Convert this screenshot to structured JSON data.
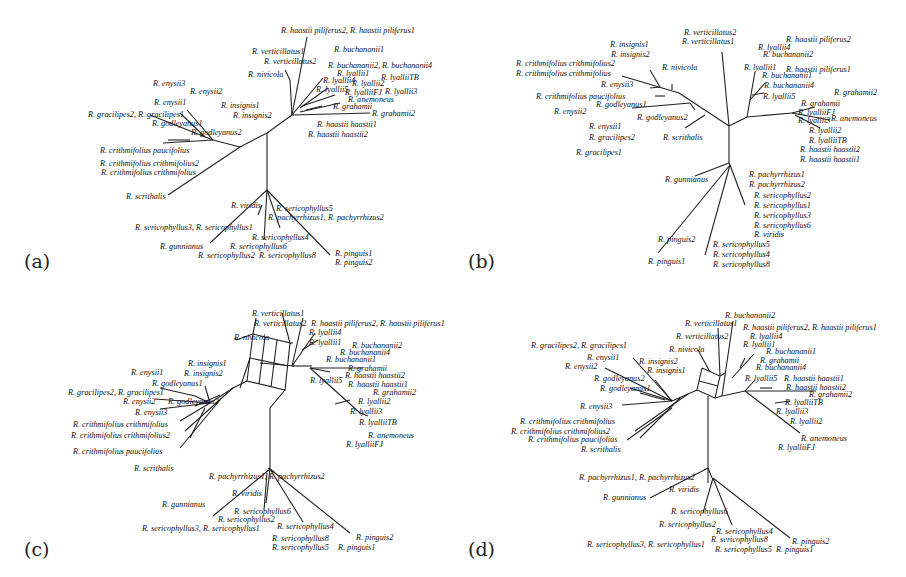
{
  "figure": {
    "panels": [
      {
        "id": "a",
        "label": "(a)",
        "type": "tree",
        "taxa": [
          {
            "text": "R. haastii piliferus2, R. haastii piliferus1",
            "x": 281,
            "y": 27
          },
          {
            "text": "R. buchananii1",
            "x": 334,
            "y": 46
          },
          {
            "text": "R. verticillatus1",
            "x": 252,
            "y": 48
          },
          {
            "text": "R. verticillatus2",
            "x": 264,
            "y": 58
          },
          {
            "text": "R. buchananii2, R. buchananii4",
            "x": 328,
            "y": 62
          },
          {
            "text": "R. lyallii1",
            "x": 337,
            "y": 70
          },
          {
            "text": "R. nivicola",
            "x": 248,
            "y": 71
          },
          {
            "text": "R. lyallii4",
            "x": 323,
            "y": 77
          },
          {
            "text": "R. lyallii2",
            "x": 352,
            "y": 80
          },
          {
            "text": "R. lyalliiTB",
            "x": 381,
            "y": 74
          },
          {
            "text": "R. lyallii5",
            "x": 316,
            "y": 86
          },
          {
            "text": "R. lyalliiFJ",
            "x": 345,
            "y": 89
          },
          {
            "text": "R. lyallii3",
            "x": 385,
            "y": 88
          },
          {
            "text": "R. anemoneus",
            "x": 348,
            "y": 96
          },
          {
            "text": "R. grahamii",
            "x": 333,
            "y": 103
          },
          {
            "text": "R. grahamii2",
            "x": 372,
            "y": 110
          },
          {
            "text": "R. haastii haastii1",
            "x": 317,
            "y": 121
          },
          {
            "text": "R. haastii haastii2",
            "x": 308,
            "y": 131
          },
          {
            "text": "R. enysii3",
            "x": 153,
            "y": 80
          },
          {
            "text": "R. enysii2",
            "x": 190,
            "y": 88
          },
          {
            "text": "R. enysii1",
            "x": 154,
            "y": 99
          },
          {
            "text": "R. insignis1",
            "x": 221,
            "y": 102
          },
          {
            "text": "R. gracilipes2, R. gracilipes1",
            "x": 88,
            "y": 111
          },
          {
            "text": "R. insignis2",
            "x": 233,
            "y": 112
          },
          {
            "text": "R. godleyanus1",
            "x": 152,
            "y": 120
          },
          {
            "text": "R. godleyanus2",
            "x": 191,
            "y": 129
          },
          {
            "text": "R. crithmifolius paucifolius",
            "x": 100,
            "y": 147
          },
          {
            "text": "R. crithmifolius crithmifolius2",
            "x": 100,
            "y": 160
          },
          {
            "text": "R. crithmifolius crithmifolius",
            "x": 101,
            "y": 169
          },
          {
            "text": "R. scrithalis",
            "x": 126,
            "y": 193
          },
          {
            "text": "R. viridis",
            "x": 231,
            "y": 202
          },
          {
            "text": "R. sericophyllus5",
            "x": 276,
            "y": 205
          },
          {
            "text": "R. pachyrrhizus1, R. pachyrrhizus2",
            "x": 268,
            "y": 214
          },
          {
            "text": "R. sericophyllus3, R. sericophyllus1",
            "x": 135,
            "y": 224
          },
          {
            "text": "R. sericophyllus4",
            "x": 252,
            "y": 234
          },
          {
            "text": "R. gunnianus",
            "x": 160,
            "y": 243
          },
          {
            "text": "R. sericophyllus6",
            "x": 230,
            "y": 243
          },
          {
            "text": "R. sericophyllus2",
            "x": 198,
            "y": 252
          },
          {
            "text": "R. sericophyllus8",
            "x": 259,
            "y": 252
          },
          {
            "text": "R. pinguis1",
            "x": 335,
            "y": 250
          },
          {
            "text": "R. pinguis2",
            "x": 335,
            "y": 259
          }
        ]
      },
      {
        "id": "b",
        "label": "(b)",
        "type": "tree",
        "taxa": [
          {
            "text": "R. verticillatus2",
            "x": 234,
            "y": 29
          },
          {
            "text": "R. verticillatus1",
            "x": 232,
            "y": 38
          },
          {
            "text": "R. haastii piliferus2",
            "x": 336,
            "y": 36
          },
          {
            "text": "R. insignis1",
            "x": 160,
            "y": 41
          },
          {
            "text": "R. lyallii4",
            "x": 308,
            "y": 44
          },
          {
            "text": "R. buchananii2",
            "x": 313,
            "y": 51
          },
          {
            "text": "R. insignis2",
            "x": 161,
            "y": 51
          },
          {
            "text": "R. crithmifolius crithmifolius2",
            "x": 66,
            "y": 60
          },
          {
            "text": "R. crithmifolius crithmifolius",
            "x": 66,
            "y": 70
          },
          {
            "text": "R. nivicola",
            "x": 212,
            "y": 64
          },
          {
            "text": "R. lyallii1",
            "x": 294,
            "y": 64
          },
          {
            "text": "R. haastii piliferus1",
            "x": 336,
            "y": 66
          },
          {
            "text": "R. buchananii1",
            "x": 312,
            "y": 72
          },
          {
            "text": "R. enysii3",
            "x": 151,
            "y": 81
          },
          {
            "text": "R. buchananii4",
            "x": 314,
            "y": 82
          },
          {
            "text": "R. crithmifolius paucifolius",
            "x": 86,
            "y": 93
          },
          {
            "text": "R. lyallii5",
            "x": 313,
            "y": 93
          },
          {
            "text": "R. grahamii2",
            "x": 384,
            "y": 89
          },
          {
            "text": "R. godleyanus1",
            "x": 146,
            "y": 101
          },
          {
            "text": "R. grahamii",
            "x": 351,
            "y": 100
          },
          {
            "text": "R. enysii2",
            "x": 104,
            "y": 108
          },
          {
            "text": "R. lyalliiFJ",
            "x": 348,
            "y": 109
          },
          {
            "text": "R. godleyanus2",
            "x": 187,
            "y": 114
          },
          {
            "text": "R. lyallii3",
            "x": 348,
            "y": 117
          },
          {
            "text": "R. anemoneus",
            "x": 381,
            "y": 115
          },
          {
            "text": "R. enysii1",
            "x": 139,
            "y": 123
          },
          {
            "text": "R. lyallii2",
            "x": 359,
            "y": 127
          },
          {
            "text": "R. gracilipes2",
            "x": 139,
            "y": 134
          },
          {
            "text": "R. scrithalis",
            "x": 213,
            "y": 134
          },
          {
            "text": "R. lyalliiTB",
            "x": 359,
            "y": 137
          },
          {
            "text": "R. haastii haastii2",
            "x": 350,
            "y": 146
          },
          {
            "text": "R. haastii haastii1",
            "x": 350,
            "y": 156
          },
          {
            "text": "R. gracilipes1",
            "x": 126,
            "y": 149
          },
          {
            "text": "R. gunnianus",
            "x": 215,
            "y": 176
          },
          {
            "text": "R. pachyrrhizus1",
            "x": 299,
            "y": 171
          },
          {
            "text": "R. pachyrrhizus2",
            "x": 299,
            "y": 181
          },
          {
            "text": "R. sericophyllus2",
            "x": 304,
            "y": 192
          },
          {
            "text": "R. sericophyllus1",
            "x": 304,
            "y": 202
          },
          {
            "text": "R. sericophyllus3",
            "x": 304,
            "y": 212
          },
          {
            "text": "R. sericophyllus6",
            "x": 304,
            "y": 222
          },
          {
            "text": "R. viridis",
            "x": 304,
            "y": 231
          },
          {
            "text": "R. pinguis2",
            "x": 208,
            "y": 236
          },
          {
            "text": "R. sericophyllus5",
            "x": 263,
            "y": 241
          },
          {
            "text": "R. sericophyllus4",
            "x": 263,
            "y": 251
          },
          {
            "text": "R. pinguis1",
            "x": 198,
            "y": 258
          },
          {
            "text": "R. sericophyllus8",
            "x": 263,
            "y": 261
          }
        ]
      },
      {
        "id": "c",
        "label": "(c)",
        "type": "network",
        "taxa": [
          {
            "text": "R. verticillatus1",
            "x": 252,
            "y": 22
          },
          {
            "text": "R. verticillatus2",
            "x": 254,
            "y": 32
          },
          {
            "text": "R. haastii piliferus2, R. haastii piliferus1",
            "x": 311,
            "y": 32
          },
          {
            "text": "R. lyallii4",
            "x": 309,
            "y": 41
          },
          {
            "text": "R. nivicola",
            "x": 234,
            "y": 46
          },
          {
            "text": "R. lyallii1",
            "x": 309,
            "y": 51
          },
          {
            "text": "R. buchananii2",
            "x": 352,
            "y": 54
          },
          {
            "text": "R. buchananii4",
            "x": 340,
            "y": 61
          },
          {
            "text": "R. buchananii1",
            "x": 326,
            "y": 68
          },
          {
            "text": "R. grahamii",
            "x": 348,
            "y": 77
          },
          {
            "text": "R. insignis1",
            "x": 188,
            "y": 72
          },
          {
            "text": "R. enysii1",
            "x": 131,
            "y": 81
          },
          {
            "text": "R. insignis2",
            "x": 184,
            "y": 82
          },
          {
            "text": "R. haastii haastii2",
            "x": 345,
            "y": 84
          },
          {
            "text": "R. lyallii5",
            "x": 310,
            "y": 89
          },
          {
            "text": "R. haastii haastii1",
            "x": 348,
            "y": 93
          },
          {
            "text": "R. godleyanus1",
            "x": 152,
            "y": 92
          },
          {
            "text": "R. gracilipes2, R. gracilipes1",
            "x": 68,
            "y": 101
          },
          {
            "text": "R. grahamii2",
            "x": 373,
            "y": 101
          },
          {
            "text": "R. enysii2",
            "x": 123,
            "y": 110
          },
          {
            "text": "R. godleyanus2",
            "x": 168,
            "y": 110
          },
          {
            "text": "R. lyallii2",
            "x": 358,
            "y": 110
          },
          {
            "text": "R. enysii3",
            "x": 135,
            "y": 121
          },
          {
            "text": "R. lyallii3",
            "x": 350,
            "y": 120
          },
          {
            "text": "R. crithmifolius crithmifolius",
            "x": 73,
            "y": 133
          },
          {
            "text": "R. lyalliiTB",
            "x": 359,
            "y": 131
          },
          {
            "text": "R. crithmifolius crithmifolius2",
            "x": 71,
            "y": 144
          },
          {
            "text": "R. anemoneus",
            "x": 368,
            "y": 144
          },
          {
            "text": "R. lyalliiFJ",
            "x": 346,
            "y": 153
          },
          {
            "text": "R. crithmifolius paucifolius",
            "x": 73,
            "y": 160
          },
          {
            "text": "R. scrithalis",
            "x": 134,
            "y": 177
          },
          {
            "text": "R. pachyrrhizus1, R. pachyrrhizus2",
            "x": 209,
            "y": 185
          },
          {
            "text": "R. viridis",
            "x": 232,
            "y": 202
          },
          {
            "text": "R. gunnianus",
            "x": 162,
            "y": 213
          },
          {
            "text": "R. sericophyllus6",
            "x": 234,
            "y": 220
          },
          {
            "text": "R. sericophyllus2",
            "x": 218,
            "y": 228
          },
          {
            "text": "R. sericophyllus3, R. sericophyllus1",
            "x": 142,
            "y": 237
          },
          {
            "text": "R. sericophyllus4",
            "x": 277,
            "y": 235
          },
          {
            "text": "R. pinguis2",
            "x": 356,
            "y": 246
          },
          {
            "text": "R. sericophyllus8",
            "x": 272,
            "y": 247
          },
          {
            "text": "R. sericophyllus5",
            "x": 272,
            "y": 256
          },
          {
            "text": "R. pinguis1",
            "x": 338,
            "y": 256
          }
        ]
      },
      {
        "id": "d",
        "label": "(d)",
        "type": "network",
        "taxa": [
          {
            "text": "R. buchananii2",
            "x": 275,
            "y": 24
          },
          {
            "text": "R. verticillatus1",
            "x": 235,
            "y": 32
          },
          {
            "text": "R. haastii piliferus2, R. haastii piliferus1",
            "x": 293,
            "y": 36
          },
          {
            "text": "R. verticillatus2",
            "x": 226,
            "y": 45
          },
          {
            "text": "R. lyallii4",
            "x": 300,
            "y": 45
          },
          {
            "text": "R. gracilipes2, R. gracilipes1",
            "x": 81,
            "y": 54
          },
          {
            "text": "R. lyallii1",
            "x": 293,
            "y": 53
          },
          {
            "text": "R. nivicola",
            "x": 219,
            "y": 58
          },
          {
            "text": "R. buchananii1",
            "x": 316,
            "y": 60
          },
          {
            "text": "R. enysii1",
            "x": 137,
            "y": 66
          },
          {
            "text": "R. grahamii",
            "x": 310,
            "y": 69
          },
          {
            "text": "R. insignis2",
            "x": 189,
            "y": 70
          },
          {
            "text": "R. enysii2",
            "x": 115,
            "y": 75
          },
          {
            "text": "R. buchananii4",
            "x": 306,
            "y": 76
          },
          {
            "text": "R. insignis1",
            "x": 197,
            "y": 79
          },
          {
            "text": "R. godleyanus2",
            "x": 144,
            "y": 87
          },
          {
            "text": "R. lyallii5",
            "x": 295,
            "y": 87
          },
          {
            "text": "R. haastii haastii1",
            "x": 334,
            "y": 87
          },
          {
            "text": "R. godleyanus1",
            "x": 150,
            "y": 97
          },
          {
            "text": "R. haastii haastii2",
            "x": 336,
            "y": 96
          },
          {
            "text": "R. grahamii2",
            "x": 359,
            "y": 103
          },
          {
            "text": "R. lyalliiTB",
            "x": 335,
            "y": 111
          },
          {
            "text": "R. enysii3",
            "x": 130,
            "y": 115
          },
          {
            "text": "R. lyallii3",
            "x": 326,
            "y": 120
          },
          {
            "text": "R. lyallii2",
            "x": 340,
            "y": 130
          },
          {
            "text": "R. crithmifolius crithmifolius",
            "x": 70,
            "y": 130
          },
          {
            "text": "R. crithmifolius crithmifolius2",
            "x": 61,
            "y": 140
          },
          {
            "text": "R. anemoneus",
            "x": 351,
            "y": 147
          },
          {
            "text": "R. crithmifolius paucifolius",
            "x": 78,
            "y": 148
          },
          {
            "text": "R. lyalliiFJ",
            "x": 328,
            "y": 156
          },
          {
            "text": "R. scrithalis",
            "x": 131,
            "y": 158
          },
          {
            "text": "R. pachyrrhizus1, R. pachyrrhizus2",
            "x": 129,
            "y": 186
          },
          {
            "text": "R. viridis",
            "x": 219,
            "y": 198
          },
          {
            "text": "R. gunnianus",
            "x": 153,
            "y": 206
          },
          {
            "text": "R. sericophyllus6",
            "x": 221,
            "y": 220
          },
          {
            "text": "R. sericophyllus2",
            "x": 209,
            "y": 233
          },
          {
            "text": "R. sericophyllus4",
            "x": 266,
            "y": 240
          },
          {
            "text": "R. sericophyllus8",
            "x": 261,
            "y": 248
          },
          {
            "text": "R. pinguis2",
            "x": 342,
            "y": 250
          },
          {
            "text": "R. sericophyllus3, R. sericophyllus1",
            "x": 137,
            "y": 253
          },
          {
            "text": "R. sericophyllus5",
            "x": 265,
            "y": 258
          },
          {
            "text": "R. pinguis1",
            "x": 326,
            "y": 258
          }
        ]
      }
    ]
  }
}
